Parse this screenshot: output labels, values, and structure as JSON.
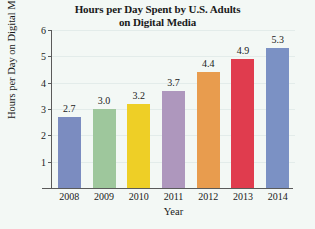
{
  "chart_data": {
    "type": "bar",
    "title": "Hours per Day Spent by U.S. Adults on Digital Media",
    "title_line1": "Hours per Day Spent by U.S. Adults",
    "title_line2": "on Digital Media",
    "xlabel": "Year",
    "ylabel": "Hours per Day on Digital Media",
    "categories": [
      "2008",
      "2009",
      "2010",
      "2011",
      "2012",
      "2013",
      "2014"
    ],
    "values": [
      2.7,
      3.0,
      3.2,
      3.7,
      4.4,
      4.9,
      5.3
    ],
    "value_labels": [
      "2.7",
      "3.0",
      "3.2",
      "3.7",
      "4.4",
      "4.9",
      "5.3"
    ],
    "bar_colors": [
      "#7b8cc0",
      "#9ec79c",
      "#eecf26",
      "#ae97bd",
      "#e89c4e",
      "#e03c4e",
      "#7b91c4"
    ],
    "ylim": [
      0,
      6
    ],
    "yticks": [
      "1",
      "2",
      "3",
      "4",
      "5",
      "6"
    ],
    "ytick_values": [
      1,
      2,
      3,
      4,
      5,
      6
    ],
    "grid": true,
    "legend": "none",
    "background_color": "#f3f8f5",
    "axis_color": "#5a5a5a",
    "grid_color": "#e3ecea"
  }
}
